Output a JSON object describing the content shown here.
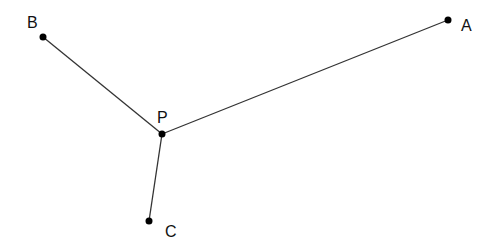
{
  "diagram": {
    "type": "geometry-points",
    "background": "#ffffff",
    "line_color": "#333333",
    "point_color": "#000000",
    "points": [
      {
        "id": "A",
        "label": "A",
        "x": 448,
        "y": 20,
        "label_x": 461,
        "label_y": 31
      },
      {
        "id": "B",
        "label": "B",
        "x": 43,
        "y": 37,
        "label_x": 27,
        "label_y": 28
      },
      {
        "id": "P",
        "label": "P",
        "x": 162,
        "y": 134,
        "label_x": 157,
        "label_y": 123
      },
      {
        "id": "C",
        "label": "C",
        "x": 149,
        "y": 221,
        "label_x": 165,
        "label_y": 237
      }
    ],
    "segments": [
      {
        "from": "P",
        "to": "A",
        "name": "segment-PA"
      },
      {
        "from": "P",
        "to": "B",
        "name": "segment-PB"
      },
      {
        "from": "P",
        "to": "C",
        "name": "segment-PC"
      }
    ]
  }
}
